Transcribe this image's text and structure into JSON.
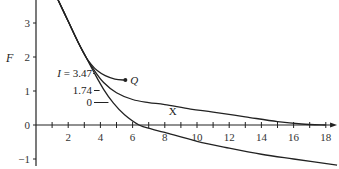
{
  "chart_data": {
    "type": "line",
    "title": "",
    "xlabel": "X",
    "ylabel": "F",
    "xlim": [
      0,
      18.7
    ],
    "ylim": [
      -1.2,
      3.7
    ],
    "x_ticks_minor": [
      1,
      2,
      3,
      4,
      5,
      6,
      7,
      8,
      9,
      10,
      11,
      12,
      13,
      14,
      15,
      16,
      17,
      18
    ],
    "x_tick_labels": [
      "2",
      "4",
      "6",
      "8",
      "10",
      "12",
      "14",
      "16",
      "18"
    ],
    "x_tick_values": [
      2,
      4,
      6,
      8,
      10,
      12,
      14,
      16,
      18
    ],
    "y_tick_labels": [
      "-1",
      "0",
      "1",
      "2",
      "3"
    ],
    "y_tick_values": [
      -1,
      0,
      1,
      2,
      3
    ],
    "grid": false,
    "series": [
      {
        "name": "I = 3.47",
        "label": "I = 3.47",
        "end_marker": "Q",
        "x": [
          1.35,
          2.0,
          2.6,
          3.1,
          3.4,
          3.8,
          4.3,
          4.9,
          5.55
        ],
        "y": [
          3.7,
          3.05,
          2.45,
          2.0,
          1.8,
          1.6,
          1.45,
          1.35,
          1.32
        ]
      },
      {
        "name": "I = 1.74",
        "label": "1.74",
        "x": [
          1.35,
          2.0,
          2.6,
          3.1,
          3.6,
          4.2,
          5.0,
          6.0,
          7.0,
          8.0,
          9.6,
          11.0,
          13.0,
          15.0,
          16.5,
          18.0
        ],
        "y": [
          3.7,
          3.05,
          2.45,
          2.0,
          1.62,
          1.25,
          0.95,
          0.75,
          0.66,
          0.6,
          0.47,
          0.38,
          0.24,
          0.1,
          0.03,
          0.0
        ]
      },
      {
        "name": "I = 0",
        "label": "0",
        "x": [
          1.35,
          2.0,
          2.6,
          3.1,
          3.6,
          4.2,
          4.8,
          5.5,
          6.4,
          7.2,
          8.0,
          10.0,
          12.0,
          14.0,
          16.0,
          18.7
        ],
        "y": [
          3.7,
          3.05,
          2.45,
          2.0,
          1.55,
          1.05,
          0.65,
          0.3,
          0.0,
          -0.12,
          -0.22,
          -0.48,
          -0.68,
          -0.86,
          -1.0,
          -1.18
        ]
      }
    ],
    "annotations": [
      {
        "text": "Q",
        "at_series": "I = 3.47",
        "position": "end"
      },
      {
        "text": "X",
        "near_x": 8.5,
        "near_y": 0.3
      }
    ]
  }
}
